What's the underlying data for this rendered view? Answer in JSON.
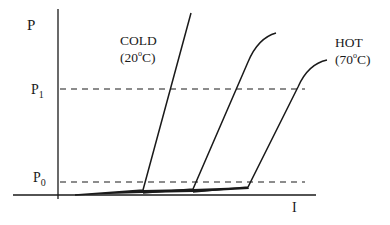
{
  "diagram": {
    "title": "",
    "y_axis_label": "P",
    "x_axis_label": "I",
    "levels": [
      {
        "name": "P1",
        "base": "P",
        "sub": "1",
        "y": 89
      },
      {
        "name": "P0",
        "base": "P",
        "sub": "0",
        "y": 182
      }
    ],
    "curves": [
      {
        "name": "cold",
        "label_line1": "COLD",
        "label_line2_pre": "(20",
        "label_line2_sup": "o",
        "label_line2_post": "C)"
      },
      {
        "name": "middle"
      },
      {
        "name": "hot",
        "label_line1": "HOT",
        "label_line2_pre": "(70",
        "label_line2_sup": "o",
        "label_line2_post": "C)"
      }
    ],
    "colors": {
      "line": "#1a1a1a",
      "background": "#ffffff"
    }
  }
}
